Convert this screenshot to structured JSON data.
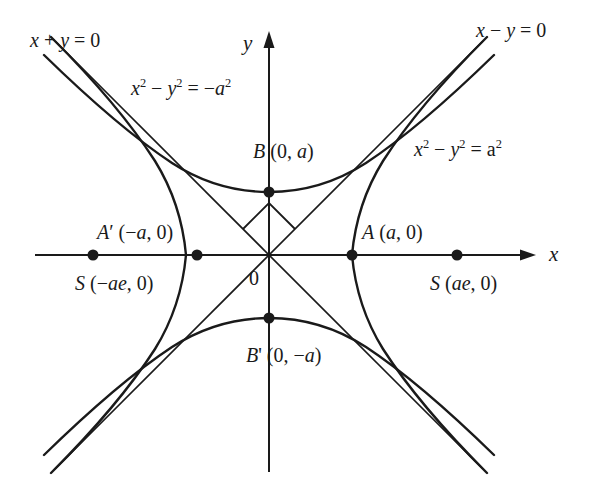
{
  "figure": {
    "width": 593,
    "height": 494,
    "background": "#ffffff",
    "stroke": "#1a1a1a"
  },
  "axes": {
    "x_label": "x",
    "y_label": "y",
    "origin_label": "0",
    "x_axis": {
      "x1": 35,
      "x2": 535,
      "y": 255,
      "arrow": "right"
    },
    "y_axis": {
      "y1": 32,
      "y2": 472,
      "x": 269,
      "arrow": "up"
    }
  },
  "labels": {
    "asymptote_left": "x + y = 0",
    "asymptote_right": "x − y = 0",
    "conjugate_equation_prefix": "x",
    "conjugate_equation": "x² − y² = −a²",
    "main_equation": "x² − y² = a²",
    "vertex_b": "B (0, a)",
    "vertex_b_prime": "B' (0, −a)",
    "vertex_a": "A (a, 0)",
    "vertex_a_prime": "A′ (−a, 0)",
    "focus_right": "S (ae, 0)",
    "focus_left": "S (−ae, 0)"
  },
  "points": [
    {
      "name": "vertex-a-prime",
      "label": "A′ (−a, 0)",
      "cx": 197,
      "cy": 255,
      "r": 5
    },
    {
      "name": "focus-left",
      "label": "S (−ae, 0)",
      "cx": 93,
      "cy": 255,
      "r": 5
    },
    {
      "name": "vertex-a",
      "label": "A (a, 0)",
      "cx": 352,
      "cy": 255,
      "r": 5
    },
    {
      "name": "focus-right",
      "label": "S (ae, 0)",
      "cx": 457,
      "cy": 255,
      "r": 5
    },
    {
      "name": "vertex-b",
      "label": "B (0, a)",
      "cx": 269,
      "cy": 192,
      "r": 5
    },
    {
      "name": "vertex-b-prime",
      "label": "B' (0, −a)",
      "cx": 269,
      "cy": 318,
      "r": 5
    }
  ],
  "geometry": {
    "a_pixels": 63,
    "asymptote_slopes": [
      1,
      -1
    ],
    "right_angle_marker": "square at intersection of asymptotes above origin",
    "branches": [
      "right branch through A (a,0)",
      "left branch through A′ (−a,0)",
      "upper branch through B (0,a)",
      "lower branch through B′ (0,−a)"
    ]
  }
}
